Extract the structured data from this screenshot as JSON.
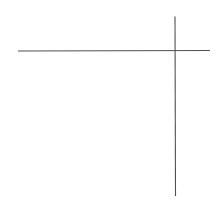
{
  "canvas": {
    "width": 218,
    "height": 206,
    "background": "#ffffff"
  },
  "lines": [
    {
      "name": "horizontal-line",
      "x1": 18,
      "y1": 51,
      "x2": 210,
      "y2": 50.5,
      "color": "#505050",
      "width": 1.1
    },
    {
      "name": "vertical-line",
      "x1": 175,
      "y1": 16.5,
      "x2": 175.5,
      "y2": 196,
      "color": "#505050",
      "width": 1.1
    }
  ]
}
